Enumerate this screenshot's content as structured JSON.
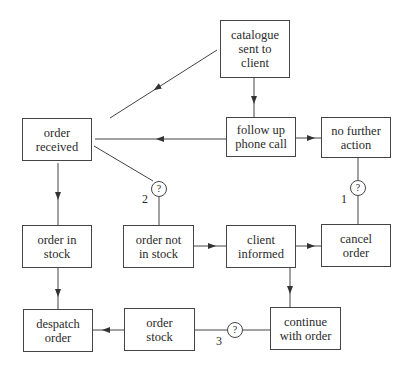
{
  "diagram": {
    "type": "flowchart",
    "nodes": [
      {
        "id": "catalogue",
        "lines": [
          "catalogue",
          "sent to",
          "client"
        ]
      },
      {
        "id": "follow_up",
        "lines": [
          "follow up",
          "phone call"
        ]
      },
      {
        "id": "no_further_action",
        "lines": [
          "no further",
          "action"
        ]
      },
      {
        "id": "order_received",
        "lines": [
          "order",
          "received"
        ]
      },
      {
        "id": "order_in_stock",
        "lines": [
          "order in",
          "stock"
        ]
      },
      {
        "id": "order_not_in_stock",
        "lines": [
          "order not",
          "in stock"
        ]
      },
      {
        "id": "client_informed",
        "lines": [
          "client",
          "informed"
        ]
      },
      {
        "id": "cancel_order",
        "lines": [
          "cancel",
          "order"
        ]
      },
      {
        "id": "despatch_order",
        "lines": [
          "despatch",
          "order"
        ]
      },
      {
        "id": "order_stock",
        "lines": [
          "order",
          "stock"
        ]
      },
      {
        "id": "continue_with_order",
        "lines": [
          "continue",
          "with order"
        ]
      }
    ],
    "decisions": [
      {
        "symbol": "?",
        "label": "1",
        "between": [
          "no_further_action",
          "cancel_order"
        ]
      },
      {
        "symbol": "?",
        "label": "2",
        "between": [
          "order_received",
          "order_not_in_stock"
        ]
      },
      {
        "symbol": "?",
        "label": "3",
        "between": [
          "continue_with_order",
          "order_stock"
        ]
      }
    ],
    "edges": [
      {
        "from": "catalogue",
        "to": "order_received"
      },
      {
        "from": "catalogue",
        "to": "follow_up"
      },
      {
        "from": "follow_up",
        "to": "order_received"
      },
      {
        "from": "follow_up",
        "to": "no_further_action"
      },
      {
        "from": "order_received",
        "to": "order_in_stock"
      },
      {
        "from": "order_received",
        "to": "order_not_in_stock",
        "via_decision": "2"
      },
      {
        "from": "no_further_action",
        "to": "cancel_order",
        "via_decision": "1"
      },
      {
        "from": "order_not_in_stock",
        "to": "client_informed"
      },
      {
        "from": "client_informed",
        "to": "cancel_order"
      },
      {
        "from": "client_informed",
        "to": "continue_with_order"
      },
      {
        "from": "order_in_stock",
        "to": "despatch_order"
      },
      {
        "from": "continue_with_order",
        "to": "order_stock",
        "via_decision": "3"
      },
      {
        "from": "order_stock",
        "to": "despatch_order"
      }
    ]
  }
}
